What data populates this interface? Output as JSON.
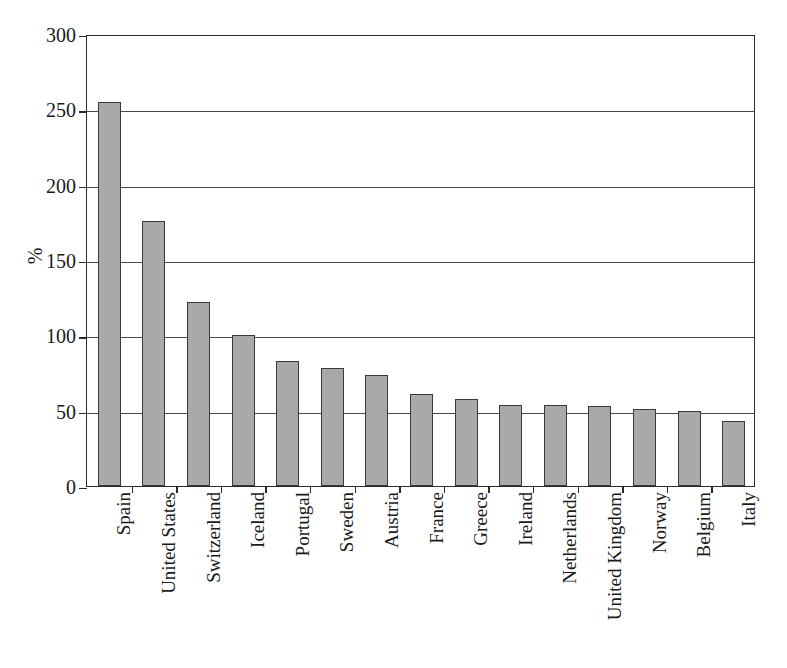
{
  "chart_data": {
    "type": "bar",
    "title": "",
    "subtitle": "",
    "xlabel": "",
    "ylabel": "%",
    "ylim": [
      0,
      300
    ],
    "yticks": [
      0,
      50,
      100,
      150,
      200,
      250,
      300
    ],
    "ytick_labels": [
      "0",
      "50",
      "100",
      "150",
      "200",
      "250",
      "300"
    ],
    "grid": true,
    "legend": false,
    "legend_position": "none",
    "bar_color": "#a9a9a9",
    "bar_edge_color": "#3a3a3a",
    "axis_color": "#2a2a2a",
    "categories": [
      "Spain",
      "United States",
      "Switzerland",
      "Iceland",
      "Portugal",
      "Sweden",
      "Austria",
      "France",
      "Greece",
      "Ireland",
      "Netherlands",
      "United Kingdom",
      "Norway",
      "Belgium",
      "Italy"
    ],
    "values": [
      255,
      176,
      122,
      100,
      83,
      78,
      74,
      61,
      58,
      54,
      54,
      53,
      51,
      50,
      43
    ]
  }
}
